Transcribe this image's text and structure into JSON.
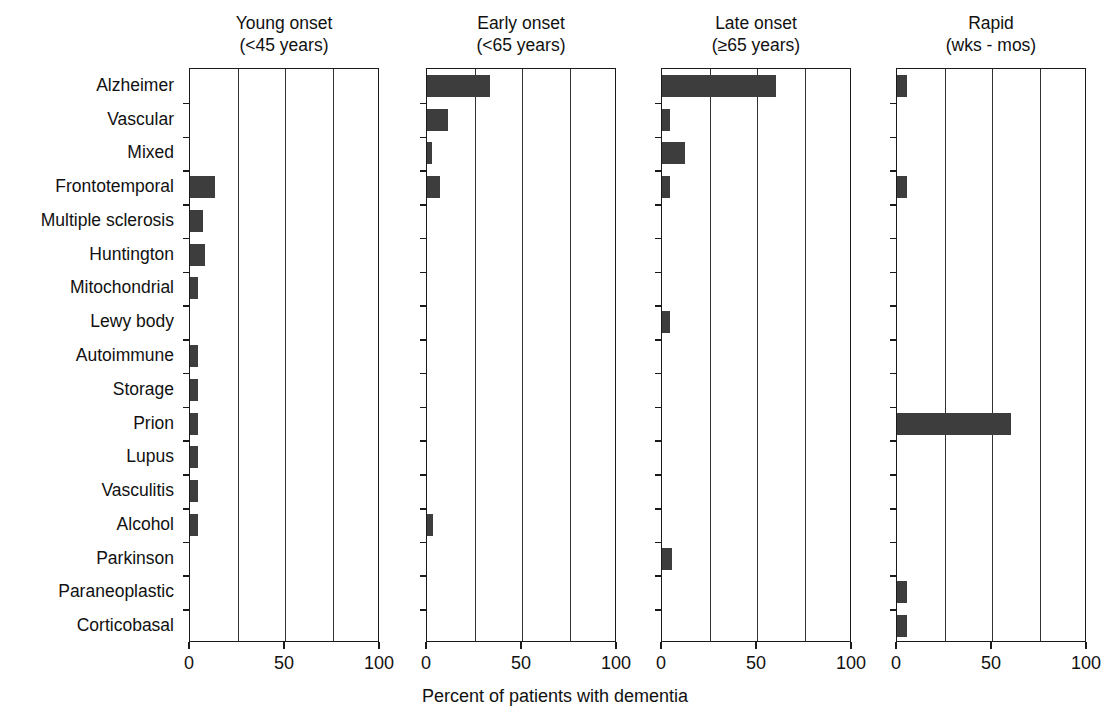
{
  "chart_data": {
    "type": "bar",
    "orientation": "horizontal",
    "title": "",
    "xlabel": "Percent of patients with dementia",
    "ylabel": "",
    "xlim": [
      0,
      100
    ],
    "xticks": [
      0,
      50,
      100
    ],
    "xtick_labels": [
      "0",
      "50",
      "100"
    ],
    "gridlines_at": [
      25,
      50,
      75
    ],
    "grid": true,
    "legend": "none",
    "categories": [
      "Alzheimer",
      "Vascular",
      "Mixed",
      "Frontotemporal",
      "Multiple sclerosis",
      "Huntington",
      "Mitochondrial",
      "Lewy body",
      "Autoimmune",
      "Storage",
      "Prion",
      "Lupus",
      "Vasculitis",
      "Alcohol",
      "Parkinson",
      "Paraneoplastic",
      "Corticobasal"
    ],
    "panels": [
      {
        "id": "young-onset",
        "title_line1": "Young onset",
        "title_line2": "(<45 years)",
        "values": [
          0,
          0,
          0,
          13,
          7,
          8,
          4,
          0,
          4,
          4,
          4,
          4,
          4,
          4,
          0,
          0,
          0
        ]
      },
      {
        "id": "early-onset",
        "title_line1": "Early onset",
        "title_line2": "(<65 years)",
        "values": [
          33,
          11,
          2.5,
          7,
          0,
          0,
          0,
          0,
          0,
          0,
          0,
          0,
          0,
          3,
          0,
          0,
          0
        ]
      },
      {
        "id": "late-onset",
        "title_line1": "Late onset",
        "title_line2": "(≥65 years)",
        "values": [
          60,
          4,
          12,
          4,
          0,
          0,
          0,
          4,
          0,
          0,
          0,
          0,
          0,
          0,
          5,
          0,
          0
        ]
      },
      {
        "id": "rapid",
        "title_line1": "Rapid",
        "title_line2": "(wks - mos)",
        "values": [
          5,
          0,
          0,
          5,
          0,
          0,
          0,
          0,
          0,
          0,
          60,
          0,
          0,
          0,
          0,
          5,
          5
        ]
      }
    ],
    "colors": {
      "bar": "#3d3d3d",
      "axis": "#1a1a1a",
      "grid": "#333333",
      "background": "#ffffff",
      "text": "#111111"
    }
  }
}
